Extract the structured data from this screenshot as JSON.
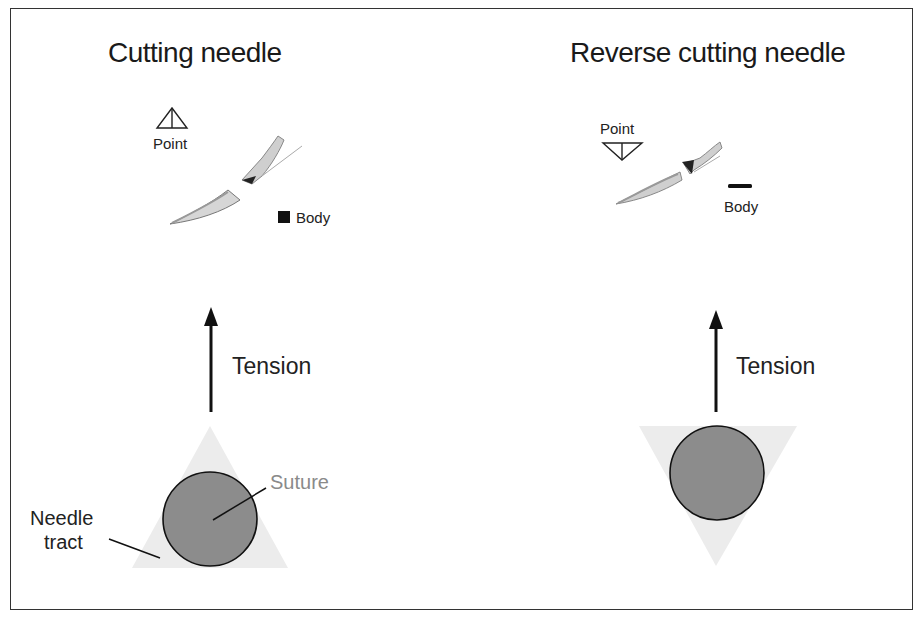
{
  "panels": [
    {
      "title": "Cutting needle",
      "point_label": "Point",
      "body_label": "Body",
      "point_shape": "triangle-up",
      "body_shape": "square",
      "tension_label": "Tension",
      "tract_shape": "triangle-up",
      "suture_label": "Suture",
      "tract_label_line1": "Needle",
      "tract_label_line2": "tract"
    },
    {
      "title": "Reverse cutting needle",
      "point_label": "Point",
      "body_label": "Body",
      "point_shape": "triangle-down",
      "body_shape": "flat-bar",
      "tension_label": "Tension",
      "tract_shape": "triangle-down"
    }
  ],
  "colors": {
    "suture_fill": "#8c8c8c",
    "tract_fill": "#ececec",
    "suture_label": "#8a8a8a",
    "stroke": "#111111"
  }
}
